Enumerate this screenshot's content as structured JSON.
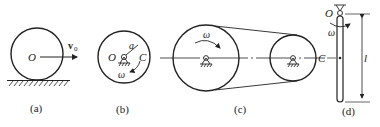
{
  "figures": [
    {
      "id": "a",
      "caption": "(a)",
      "labels": {
        "center": "O",
        "velocity": "v",
        "velocity_sub": "0"
      },
      "description": "Disk rolling on ground with center velocity v0"
    },
    {
      "id": "b",
      "caption": "(b)",
      "labels": {
        "pivot": "O",
        "offset": "a",
        "mass_center": "C",
        "angular_velocity": "ω"
      },
      "description": "Disk rotating about fixed pivot O with eccentric center C"
    },
    {
      "id": "c",
      "caption": "(c)",
      "labels": {
        "angular_velocity": "ω"
      },
      "description": "Belt drive with two pulleys"
    },
    {
      "id": "d",
      "caption": "(d)",
      "labels": {
        "pivot": "O",
        "angular_velocity": "ω",
        "mass_center": "C",
        "length": "l"
      },
      "description": "Slender rod pinned at top O rotating with ω, length l"
    }
  ],
  "colors": {
    "stroke": "#222222",
    "background": "#ffffff"
  }
}
